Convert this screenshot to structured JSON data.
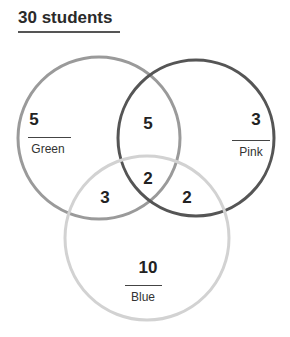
{
  "title": "30 students",
  "sets": [
    {
      "name": "Green",
      "only": "5",
      "stroke": "#9a9a9a"
    },
    {
      "name": "Pink",
      "only": "3",
      "stroke": "#555555"
    },
    {
      "name": "Blue",
      "only": "10",
      "stroke": "#cfcfcf"
    }
  ],
  "intersections": {
    "green_pink": "5",
    "green_blue": "3",
    "pink_blue": "2",
    "all_three": "2"
  },
  "total": 30
}
